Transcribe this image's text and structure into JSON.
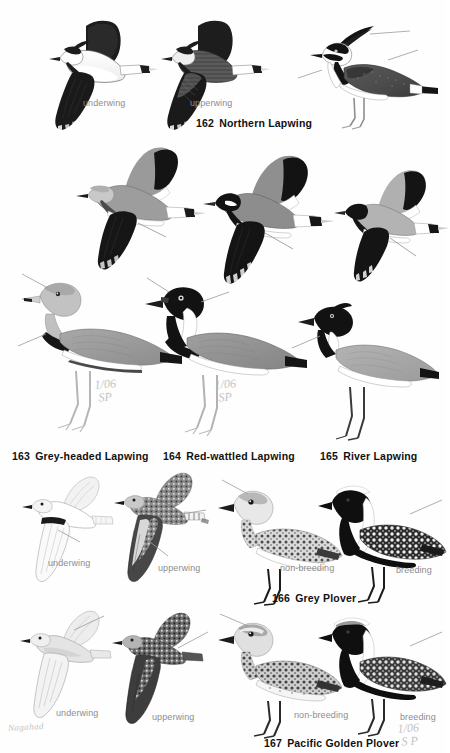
{
  "page": {
    "background_color": "#fefefe",
    "ink_color": "#111111",
    "label_color": "#8d8d8d",
    "pencil_color": "#b9b9b9",
    "signature": "Nagahad"
  },
  "species": [
    {
      "id": "northern-lapwing",
      "number": "162",
      "name": "Northern Lapwing",
      "caption_number": "162",
      "caption_name": "Northern Lapwing",
      "figures": [
        {
          "label": "underwing",
          "pose": "flight"
        },
        {
          "label": "upperwing",
          "pose": "flight"
        },
        {
          "label": "",
          "pose": "standing"
        }
      ]
    },
    {
      "id": "grey-headed-lapwing",
      "number": "163",
      "name": "Grey-headed Lapwing",
      "caption_number": "163",
      "caption_name": "Grey-headed Lapwing",
      "annotation": "1/06\n SP",
      "figures": [
        {
          "label": "",
          "pose": "flight"
        },
        {
          "label": "",
          "pose": "standing"
        }
      ]
    },
    {
      "id": "red-wattled-lapwing",
      "number": "164",
      "name": "Red-wattled Lapwing",
      "caption_number": "164",
      "caption_name": "Red-wattled Lapwing",
      "annotation": "1/06\n SP",
      "figures": [
        {
          "label": "",
          "pose": "flight"
        },
        {
          "label": "",
          "pose": "standing"
        }
      ]
    },
    {
      "id": "river-lapwing",
      "number": "165",
      "name": "River Lapwing",
      "caption_number": "165",
      "caption_name": "River Lapwing",
      "figures": [
        {
          "label": "",
          "pose": "flight"
        },
        {
          "label": "",
          "pose": "standing"
        }
      ]
    },
    {
      "id": "grey-plover",
      "number": "166",
      "name": "Grey Plover",
      "caption_number": "166",
      "caption_name": "Grey Plover",
      "figures": [
        {
          "label": "underwing",
          "pose": "flight"
        },
        {
          "label": "upperwing",
          "pose": "flight"
        },
        {
          "label": "non-breeding",
          "pose": "standing"
        },
        {
          "label": "breeding",
          "pose": "standing"
        }
      ]
    },
    {
      "id": "pacific-golden-plover",
      "number": "167",
      "name": "Pacific Golden Plover",
      "caption_number": "167",
      "caption_name": "Pacific Golden Plover",
      "annotation": "1/06\n S P",
      "figures": [
        {
          "label": "underwing",
          "pose": "flight"
        },
        {
          "label": "upperwing",
          "pose": "flight"
        },
        {
          "label": "non-breeding",
          "pose": "standing"
        },
        {
          "label": "breeding",
          "pose": "standing"
        }
      ]
    }
  ],
  "labels": {
    "underwing": "underwing",
    "upperwing": "upperwing",
    "non_breeding": "non-breeding",
    "breeding": "breeding"
  }
}
